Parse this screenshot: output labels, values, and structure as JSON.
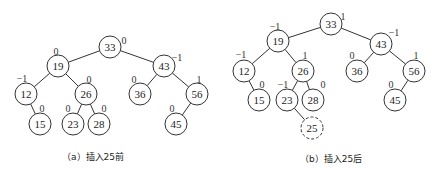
{
  "diagrams": [
    {
      "id": "a",
      "caption": "（a）插入25前",
      "caption_pos": [
        62,
        150
      ],
      "nodes": [
        {
          "key": "33",
          "x": 110,
          "y": 47,
          "bf": "0",
          "bfx": 124,
          "bfy": 40
        },
        {
          "key": "19",
          "x": 58,
          "y": 66,
          "bf": "0",
          "bfx": 56,
          "bfy": 51
        },
        {
          "key": "43",
          "x": 164,
          "y": 66,
          "bf": "−1",
          "bfx": 177,
          "bfy": 57
        },
        {
          "key": "12",
          "x": 26,
          "y": 94,
          "bf": "−1",
          "bfx": 22,
          "bfy": 78
        },
        {
          "key": "26",
          "x": 86,
          "y": 94,
          "bf": "0",
          "bfx": 89,
          "bfy": 79
        },
        {
          "key": "36",
          "x": 140,
          "y": 94,
          "bf": "0",
          "bfx": 134,
          "bfy": 79
        },
        {
          "key": "56",
          "x": 197,
          "y": 94,
          "bf": "1",
          "bfx": 199,
          "bfy": 79
        },
        {
          "key": "15",
          "x": 40,
          "y": 124,
          "bf": "0",
          "bfx": 42,
          "bfy": 108
        },
        {
          "key": "23",
          "x": 73,
          "y": 124,
          "bf": "0",
          "bfx": 68,
          "bfy": 108
        },
        {
          "key": "28",
          "x": 99,
          "y": 124,
          "bf": "0",
          "bfx": 104,
          "bfy": 108
        },
        {
          "key": "45",
          "x": 176,
          "y": 124,
          "bf": "0",
          "bfx": 172,
          "bfy": 108
        }
      ],
      "edges": [
        [
          "33",
          "19"
        ],
        [
          "33",
          "43"
        ],
        [
          "19",
          "12"
        ],
        [
          "19",
          "26"
        ],
        [
          "43",
          "36"
        ],
        [
          "43",
          "56"
        ],
        [
          "12",
          "15"
        ],
        [
          "26",
          "23"
        ],
        [
          "26",
          "28"
        ],
        [
          "56",
          "45"
        ]
      ]
    },
    {
      "id": "b",
      "caption": "（b）插入25后",
      "caption_pos": [
        300,
        152
      ],
      "nodes": [
        {
          "key": "33",
          "x": 331,
          "y": 24,
          "bf": "1",
          "bfx": 343,
          "bfy": 16
        },
        {
          "key": "19",
          "x": 278,
          "y": 41,
          "bf": "−1",
          "bfx": 275,
          "bfy": 26
        },
        {
          "key": "43",
          "x": 381,
          "y": 44,
          "bf": "−1",
          "bfx": 394,
          "bfy": 32
        },
        {
          "key": "12",
          "x": 244,
          "y": 71,
          "bf": "−1",
          "bfx": 241,
          "bfy": 54
        },
        {
          "key": "26",
          "x": 303,
          "y": 71,
          "bf": "1",
          "bfx": 305,
          "bfy": 55
        },
        {
          "key": "36",
          "x": 357,
          "y": 71,
          "bf": "0",
          "bfx": 352,
          "bfy": 55
        },
        {
          "key": "56",
          "x": 414,
          "y": 71,
          "bf": "1",
          "bfx": 416,
          "bfy": 55
        },
        {
          "key": "15",
          "x": 259,
          "y": 100,
          "bf": "0",
          "bfx": 262,
          "bfy": 84
        },
        {
          "key": "23",
          "x": 287,
          "y": 100,
          "bf": "−1",
          "bfx": 283,
          "bfy": 84
        },
        {
          "key": "28",
          "x": 313,
          "y": 100,
          "bf": "0",
          "bfx": 323,
          "bfy": 84
        },
        {
          "key": "45",
          "x": 395,
          "y": 100,
          "bf": "0",
          "bfx": 391,
          "bfy": 84
        },
        {
          "key": "25",
          "x": 312,
          "y": 128,
          "bf": "",
          "bfx": 0,
          "bfy": 0,
          "dashed": true
        }
      ],
      "edges": [
        [
          "33",
          "19"
        ],
        [
          "33",
          "43"
        ],
        [
          "19",
          "12"
        ],
        [
          "19",
          "26"
        ],
        [
          "43",
          "36"
        ],
        [
          "43",
          "56"
        ],
        [
          "12",
          "15"
        ],
        [
          "26",
          "23"
        ],
        [
          "26",
          "28"
        ],
        [
          "56",
          "45"
        ],
        [
          "23",
          "25"
        ]
      ]
    }
  ],
  "node_radius": 11
}
